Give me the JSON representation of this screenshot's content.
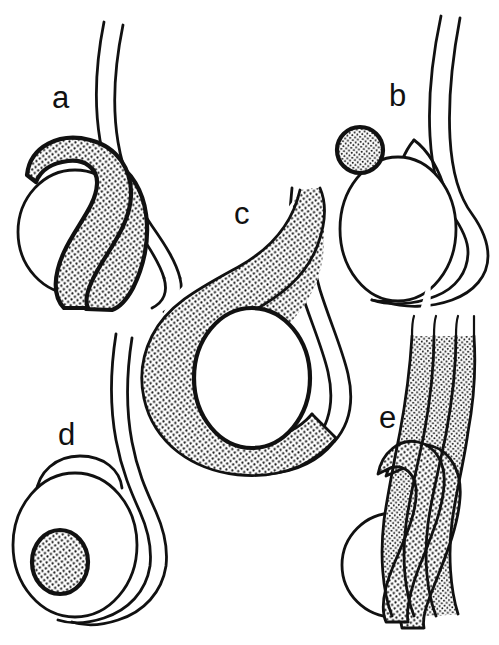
{
  "figure": {
    "background_color": "#ffffff",
    "ink_color": "#111111",
    "stipple_color": "#111111",
    "width": 499,
    "height": 645,
    "style": "black-and-white stippled line drawing"
  },
  "panels": [
    {
      "id": "a",
      "label": "a",
      "label_x": 52,
      "label_y": 108,
      "description": "Round nucleus with large crescent-shaped stippled acrosome draped over the upper-right side; two long flagellar filaments rising upward",
      "parts": [
        "nucleus",
        "acrosome",
        "flagellum"
      ],
      "stippled": true
    },
    {
      "id": "b",
      "label": "b",
      "label_x": 389,
      "label_y": 106,
      "description": "Oval nucleus with a small round stippled acrosomal vesicle attached at the upper-left; long looping flagellum around the right side",
      "parts": [
        "nucleus",
        "acrosomal-vesicle",
        "flagellum"
      ],
      "stippled": true
    },
    {
      "id": "c",
      "label": "c",
      "label_x": 234,
      "label_y": 224,
      "description": "Large teardrop-shaped stippled acrosomal mass enclosing a central oval nucleus; flagellum sweeping up along the right margin",
      "parts": [
        "nucleus",
        "acrosome",
        "flagellum"
      ],
      "stippled": true
    },
    {
      "id": "d",
      "label": "d",
      "label_x": 58,
      "label_y": 445,
      "description": "Large oval cell body with a small round stippled nucleus inside, a thin apical cap, and a flagellum looping around the right",
      "parts": [
        "cell-body",
        "nucleus",
        "flagellum"
      ],
      "stippled": true
    },
    {
      "id": "e",
      "label": "e",
      "label_x": 379,
      "label_y": 428,
      "description": "Round nucleus with elongated stippled acrosomal filaments running upward in parallel banded strands",
      "parts": [
        "nucleus",
        "acrosomal-filaments",
        "flagellum"
      ],
      "stippled": true
    }
  ],
  "legend": {
    "stipple_meaning": "stippled shading denotes acrosomal / nuclear material",
    "line_meaning": "solid outlines denote cell and flagellar membranes"
  }
}
